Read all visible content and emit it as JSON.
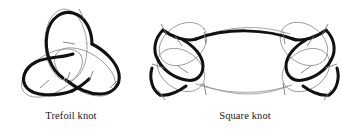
{
  "figure": {
    "background_color": "#ffffff",
    "strand_color": "#111111",
    "companion_color": "#8e8e8e",
    "tick_color": "#7b7b7b"
  },
  "panels": [
    {
      "id": "trefoil",
      "caption": "Trefoil knot",
      "crossings": 3,
      "tick_count": 6
    },
    {
      "id": "square",
      "caption": "Square knot",
      "crossings": 6,
      "tick_count": 12
    }
  ],
  "captions": {
    "trefoil": "Trefoil knot",
    "square": "Square knot"
  }
}
